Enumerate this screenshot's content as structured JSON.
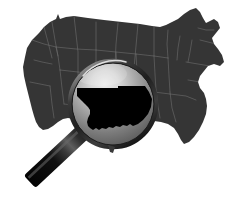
{
  "image": {
    "title": "Magnifying glass over United States map highlighting Oklahoma",
    "width": 238,
    "height": 217,
    "background_color": "#ffffff",
    "subject": "us-map-with-magnifier",
    "style": "grayscale silhouette illustration"
  },
  "map": {
    "name": "united-states-map",
    "fill_color": "#353535",
    "border_line_color": "#6e6e6e",
    "border_line_width": 0.6,
    "description": "Contiguous United States silhouette in dark gray with light gray state boundary lines",
    "regions_visible": [
      "Pacific Northwest",
      "California",
      "Great Basin",
      "Rocky Mountains",
      "Great Plains",
      "Great Lakes",
      "New England",
      "Southeast",
      "Florida",
      "Gulf Coast"
    ],
    "outline_path": "M 25 57 L 27 48 L 32 40 L 39 33 L 44 27 L 50 22 L 56 19 L 58 14 L 60 19 L 66 17 L 74 16 L 88 18 L 104 20 L 122 22 L 140 24 L 152 26 L 160 27 L 166 25 L 172 22 L 178 19 L 184 14 L 190 10 L 196 8 L 200 12 L 203 18 L 206 23 L 210 21 L 214 19 L 218 22 L 220 28 L 216 33 L 212 38 L 214 44 L 218 49 L 222 55 L 224 62 L 220 66 L 214 64 L 208 66 L 204 71 L 200 76 L 198 82 L 200 88 L 204 93 L 206 99 L 207 106 L 206 114 L 203 122 L 199 130 L 194 137 L 189 142 L 184 144 L 181 140 L 178 134 L 174 128 L 168 124 L 161 122 L 154 121 L 147 122 L 140 124 L 133 127 L 126 130 L 119 133 L 112 135 L 105 136 L 99 135 L 93 132 L 88 128 L 83 124 L 78 121 L 73 119 L 68 118 L 63 119 L 58 122 L 53 126 L 48 129 L 43 130 L 39 127 L 36 122 L 34 116 L 32 109 L 30 101 L 28 93 L 26 85 L 24 76 L 23 67 Z",
    "state_lines": [
      "M 52 22 L 55 40 L 58 56 L 60 70",
      "M 60 70 L 78 72 L 96 74",
      "M 32 40 L 44 44 L 56 47",
      "M 56 47 L 58 56",
      "M 74 16 L 76 34 L 78 52 L 78 72",
      "M 96 22 L 96 44 L 96 74",
      "M 118 23 L 116 44 L 115 66",
      "M 138 24 L 136 46 L 134 68",
      "M 60 70 L 62 88 L 64 104",
      "M 78 72 L 79 90 L 80 106",
      "M 96 74 L 97 92 L 98 108",
      "M 56 47 L 76 49 L 96 50",
      "M 96 50 L 116 52 L 136 54",
      "M 136 54 L 154 56 L 168 58",
      "M 154 26 L 154 42 L 154 56",
      "M 168 30 L 167 44 L 168 58",
      "M 180 36 L 178 48 L 177 60",
      "M 192 40 L 190 52 L 188 62",
      "M 154 56 L 155 74 L 156 90",
      "M 168 58 L 169 76 L 170 92",
      "M 136 54 L 137 72 L 138 90",
      "M 116 52 L 117 70 L 118 88",
      "M 136 90 L 154 92 L 170 94",
      "M 170 94 L 186 96 L 196 100",
      "M 156 90 L 158 106 L 160 118",
      "M 170 92 L 172 108 L 176 122",
      "M 186 62 L 198 64 L 210 66",
      "M 188 80 L 200 82 L 206 86",
      "M 198 28 L 206 30 L 214 30",
      "M 200 40 L 208 42 L 216 44",
      "M 44 27 L 48 42 L 52 58",
      "M 34 60 L 42 62 L 52 64",
      "M 30 82 L 40 84 L 50 86",
      "M 50 86 L 52 104 L 54 118",
      "M 64 104 L 80 106 L 98 108",
      "M 98 108 L 114 110 L 128 112"
    ]
  },
  "magnifier": {
    "name": "magnifying-glass",
    "center_x": 113,
    "center_y": 104,
    "lens_radius": 41,
    "ring_outer_radius": 45,
    "ring_color_dark": "#2a2a2a",
    "ring_color_light": "#c9c9c9",
    "lens_gradient_light": "#e4e4e4",
    "lens_gradient_mid": "#9a9a9a",
    "lens_gradient_dark": "#4a4a4a",
    "handle": {
      "name": "magnifier-handle",
      "color_dark": "#070707",
      "color_highlight": "#707070",
      "angle_degrees": 47,
      "length": 92,
      "width": 17
    },
    "ferrule": {
      "name": "magnifier-ferrule",
      "color_light": "#e8e8e8",
      "color_mid": "#9d9d9d",
      "color_dark": "#4f4f4f",
      "length": 24,
      "width": 19
    }
  },
  "highlight": {
    "name": "oklahoma-highlight",
    "state": "Oklahoma",
    "fill_color": "#000000",
    "description": "Oklahoma state silhouette in solid black magnified inside the lens, showing the panhandle strip to the west and the irregular Red River southern border",
    "panhandle_present": true,
    "path": "M 77 88 L 118 88 L 118 86 L 145 86 L 149 92 L 152 99 L 151 107 L 148 114 L 143 120 L 138 124 L 133 126 L 130 124 L 127 126 L 123 125 L 120 127 L 116 126 L 113 128 L 109 127 L 106 129 L 102 128 L 99 130 L 96 128 L 93 130 L 90 128 L 88 126 L 87 122 L 88 118 L 90 114 L 90 110 L 88 107 L 85 104 L 82 101 L 79 98 L 77 96 Z"
  }
}
